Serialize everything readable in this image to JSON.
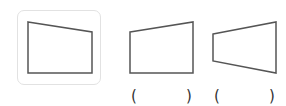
{
  "figure": {
    "shapes": [
      {
        "id": "shape-1",
        "selected": true,
        "points": "28,22 92,32 92,73 28,73"
      },
      {
        "id": "shape-2",
        "selected": false,
        "points": "130,32 193,22 193,73 130,73"
      },
      {
        "id": "shape-3",
        "selected": false,
        "points": "213,34 276,22 276,73 213,61"
      }
    ],
    "answer_blanks": [
      {
        "open": "(",
        "close": ")"
      },
      {
        "open": "(",
        "close": ")"
      }
    ],
    "colors": {
      "stroke": "#555555",
      "box_border": "#e2e2e2"
    }
  }
}
